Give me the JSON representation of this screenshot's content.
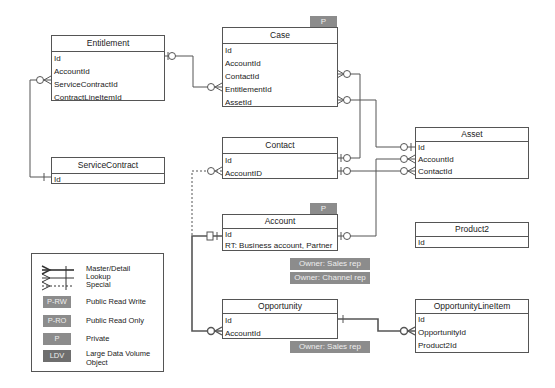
{
  "entities": {
    "entitlement": {
      "title": "Entitlement",
      "fields": [
        "Id",
        "AccountId",
        "ServiceContractId",
        "ContractLineItemId"
      ]
    },
    "case": {
      "title": "Case",
      "badge": "P",
      "fields": [
        "Id",
        "AccountId",
        "ContactId",
        "EntitlementId",
        "AssetId"
      ]
    },
    "service_contract": {
      "title": "ServiceContract",
      "fields": [
        "Id"
      ]
    },
    "contact": {
      "title": "Contact",
      "fields": [
        "Id",
        "AccountID"
      ]
    },
    "asset": {
      "title": "Asset",
      "fields": [
        "Id",
        "AccountId",
        "ContactId"
      ]
    },
    "account": {
      "title": "Account",
      "badge": "P",
      "fields": [
        "Id",
        "RT: Business account, Partner"
      ],
      "owners": [
        "Owner: Sales rep",
        "Owner: Channel rep"
      ]
    },
    "product2": {
      "title": "Product2",
      "fields": [
        "Id"
      ]
    },
    "opportunity": {
      "title": "Opportunity",
      "fields": [
        "Id",
        "AccountId"
      ],
      "owners": [
        "Owner: Sales rep"
      ]
    },
    "opportunity_line_item": {
      "title": "OpportunityLineItem",
      "fields": [
        "Id",
        "OpportunityId",
        "Product2Id"
      ]
    }
  },
  "legend": {
    "relationships": [
      "Master/Detail",
      "Lookup",
      "Special"
    ],
    "access": [
      {
        "badge": "P-RW",
        "label": "Public Read Write"
      },
      {
        "badge": "P-RO",
        "label": "Public Read Only"
      },
      {
        "badge": "P",
        "label": "Private"
      },
      {
        "badge": "LDV",
        "label": "Large Data Volume",
        "label2": "Object"
      }
    ]
  },
  "colors": {
    "line": "#555555",
    "badge": "#8c8c8c",
    "badge_dark": "#6e6e6e",
    "badge_text": "#eeeeee"
  }
}
